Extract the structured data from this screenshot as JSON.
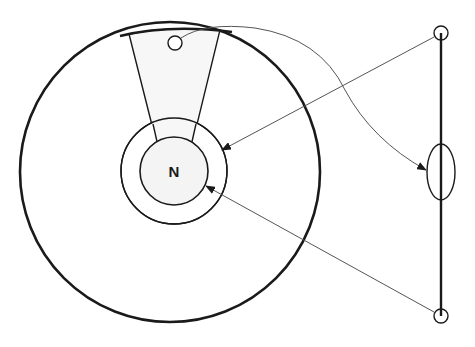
{
  "diagram": {
    "title": "",
    "center_label": "N",
    "colors": {
      "stroke": "#1a1a1a",
      "thin_stroke": "#555555",
      "background": "#ffffff",
      "sector_fill": "#f7f7f7"
    },
    "elements": [
      {
        "id": "outer-circle",
        "type": "circle",
        "cx": 170,
        "cy": 172,
        "r": 150
      },
      {
        "id": "sector",
        "type": "wedge",
        "description": "trapezoidal sector from outer circle down to inner ring"
      },
      {
        "id": "outer-ring",
        "type": "circle",
        "cx": 174,
        "cy": 171,
        "r": 53
      },
      {
        "id": "inner-circle",
        "type": "circle",
        "cx": 174,
        "cy": 171,
        "r": 34,
        "label": "N"
      },
      {
        "id": "small-hole",
        "type": "circle",
        "cx": 175,
        "cy": 43,
        "r": 7
      },
      {
        "id": "vertical-axis",
        "type": "line",
        "x": 441,
        "y1": 33,
        "y2": 316
      },
      {
        "id": "top-node",
        "type": "circle",
        "cx": 441,
        "cy": 33,
        "r": 7
      },
      {
        "id": "bottom-node",
        "type": "circle",
        "cx": 441,
        "cy": 316,
        "r": 7
      },
      {
        "id": "middle-ellipse",
        "type": "ellipse",
        "cx": 441,
        "cy": 172,
        "rx": 14,
        "ry": 28
      }
    ],
    "arrows": [
      {
        "from": "top-node",
        "to": "outer-ring",
        "style": "straight"
      },
      {
        "from": "bottom-node",
        "to": "inner-circle",
        "style": "straight"
      },
      {
        "from": "small-hole",
        "to": "middle-ellipse",
        "style": "curved"
      }
    ]
  }
}
